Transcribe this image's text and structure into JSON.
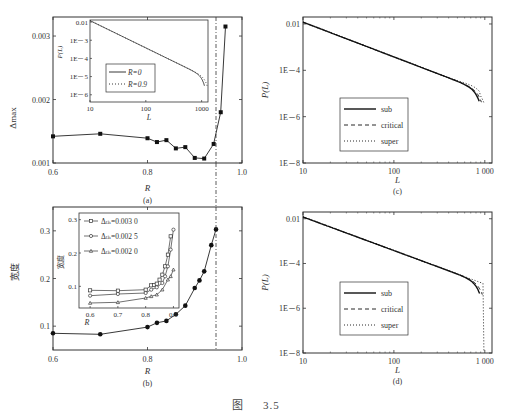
{
  "figure": {
    "caption_prefix": "图",
    "caption_number": "3.5"
  },
  "chart_data": [
    {
      "id": "a",
      "panel_label": "(a)",
      "type": "line",
      "xlabel": "R",
      "ylabel": "Δmax",
      "xlim": [
        0.6,
        1.0
      ],
      "ylim": [
        0.001,
        0.0033
      ],
      "xticks": [
        0.6,
        0.8,
        1.0
      ],
      "xtick_labels": [
        "0.6",
        "0.8",
        "1.0"
      ],
      "yticks": [
        0.001,
        0.002,
        0.003
      ],
      "ytick_labels": [
        "0.001",
        "0.002",
        "0.003"
      ],
      "vline": 0.945,
      "series": [
        {
          "name": "Δmax",
          "marker": "square-filled",
          "x": [
            0.6,
            0.7,
            0.8,
            0.82,
            0.84,
            0.86,
            0.88,
            0.9,
            0.92,
            0.94,
            0.955,
            0.965
          ],
          "y": [
            0.00142,
            0.00146,
            0.00139,
            0.00133,
            0.00136,
            0.00123,
            0.00125,
            0.00108,
            0.00107,
            0.0013,
            0.0018,
            0.00315
          ]
        }
      ],
      "inset": {
        "type": "line",
        "xscale": "log",
        "yscale": "log",
        "xlabel": "L",
        "ylabel": "P(L)",
        "xlim": [
          10,
          1300
        ],
        "ylim": [
          4e-07,
          0.013
        ],
        "xticks": [
          10,
          100,
          1000
        ],
        "xtick_labels": [
          "10",
          "100",
          "1000"
        ],
        "yticks": [
          0.01,
          0.001,
          0.0001,
          1e-05,
          1e-06
        ],
        "ytick_labels": [
          "0.01",
          "1E－3",
          "1E－4",
          "1E－5",
          "1E－6"
        ],
        "legend": [
          {
            "label": "R=0",
            "style": "solid"
          },
          {
            "label": "R=0.9",
            "style": "dotted"
          }
        ],
        "series": [
          {
            "name": "R=0",
            "exponent": -1.5,
            "cutoff": 1100
          },
          {
            "name": "R=0.9",
            "exponent": -1.5,
            "cutoff": 1250
          }
        ]
      }
    },
    {
      "id": "b",
      "panel_label": "(b)",
      "type": "line",
      "xlabel": "R",
      "ylabel": "宽度",
      "xlim": [
        0.6,
        1.0
      ],
      "ylim": [
        0.05,
        0.35
      ],
      "xticks": [
        0.6,
        0.8,
        1.0
      ],
      "xtick_labels": [
        "0.6",
        "0.8",
        "1.0"
      ],
      "yticks": [
        0.1,
        0.2,
        0.3
      ],
      "ytick_labels": [
        "0.1",
        "0.2",
        "0.3"
      ],
      "vline": 0.945,
      "series": [
        {
          "name": "宽度",
          "marker": "circle-filled",
          "x": [
            0.6,
            0.7,
            0.8,
            0.82,
            0.84,
            0.86,
            0.88,
            0.9,
            0.91,
            0.92,
            0.935,
            0.945
          ],
          "y": [
            0.085,
            0.083,
            0.098,
            0.107,
            0.111,
            0.125,
            0.143,
            0.18,
            0.196,
            0.215,
            0.27,
            0.303
          ]
        }
      ],
      "inset": {
        "type": "line",
        "xlabel": "R",
        "ylabel": "宽度",
        "xlim": [
          0.56,
          0.92
        ],
        "ylim": [
          0.035,
          0.32
        ],
        "xticks": [
          0.6,
          0.7,
          0.8,
          0.9
        ],
        "xtick_labels": [
          "0.6",
          "0.7",
          "0.8",
          "0.9"
        ],
        "yticks": [
          0.1,
          0.2,
          0.3
        ],
        "ytick_labels": [
          "0.1",
          "0.2",
          "0.3"
        ],
        "legend_symbol": "Δ",
        "legend_subscript": "th",
        "series": [
          {
            "name": "Δth=0.003 0",
            "marker": "square-open",
            "x": [
              0.6,
              0.7,
              0.8,
              0.82,
              0.83,
              0.84,
              0.85,
              0.86,
              0.87,
              0.88,
              0.89
            ],
            "y": [
              0.088,
              0.087,
              0.09,
              0.103,
              0.104,
              0.108,
              0.12,
              0.135,
              0.16,
              0.195,
              0.25
            ]
          },
          {
            "name": "Δth=0.002 5",
            "marker": "circle-open",
            "x": [
              0.6,
              0.7,
              0.8,
              0.82,
              0.84,
              0.86,
              0.87,
              0.88,
              0.89,
              0.9
            ],
            "y": [
              0.072,
              0.077,
              0.08,
              0.09,
              0.097,
              0.11,
              0.13,
              0.16,
              0.21,
              0.27
            ]
          },
          {
            "name": "Δth=0.002 0",
            "marker": "triangle-open",
            "x": [
              0.6,
              0.7,
              0.8,
              0.82,
              0.84,
              0.86,
              0.88,
              0.89,
              0.9
            ],
            "y": [
              0.05,
              0.052,
              0.065,
              0.07,
              0.075,
              0.09,
              0.12,
              0.13,
              0.15
            ]
          }
        ]
      }
    },
    {
      "id": "c",
      "panel_label": "(c)",
      "type": "line",
      "xscale": "log",
      "yscale": "log",
      "xlabel": "L",
      "ylabel": "P(L)",
      "xlim": [
        10,
        1200
      ],
      "ylim": [
        1e-08,
        0.02
      ],
      "xticks": [
        10,
        100,
        1000
      ],
      "xtick_labels": [
        "10",
        "100",
        "1 000"
      ],
      "yticks": [
        0.01,
        0.0001,
        1e-06,
        1e-08
      ],
      "ytick_labels": [
        "0.01",
        "1E－4",
        "1E－6",
        "1E－8"
      ],
      "legend": [
        {
          "label": "sub",
          "style": "solid"
        },
        {
          "label": "critical",
          "style": "dashed"
        },
        {
          "label": "super",
          "style": "dotted"
        }
      ],
      "legend_position": "lower-left",
      "series": [
        {
          "name": "sub",
          "exponent": -1.5,
          "cutoff": 850
        },
        {
          "name": "critical",
          "exponent": -1.5,
          "cutoff": 900
        },
        {
          "name": "super",
          "exponent": -1.5,
          "cutoff": 960,
          "bump": true
        }
      ]
    },
    {
      "id": "d",
      "panel_label": "(d)",
      "type": "line",
      "xscale": "log",
      "yscale": "log",
      "xlabel": "L",
      "ylabel": "P(L)",
      "xlim": [
        10,
        1200
      ],
      "ylim": [
        1e-08,
        0.02
      ],
      "xticks": [
        10,
        100,
        1000
      ],
      "xtick_labels": [
        "10",
        "100",
        "1 000"
      ],
      "yticks": [
        0.01,
        0.0001,
        1e-06,
        1e-08
      ],
      "ytick_labels": [
        "0.01",
        "1E－4",
        "1E－6",
        "1E－8"
      ],
      "legend": [
        {
          "label": "sub",
          "style": "solid"
        },
        {
          "label": "critical",
          "style": "dashed"
        },
        {
          "label": "super",
          "style": "dotted"
        }
      ],
      "legend_position": "lower-left",
      "series": [
        {
          "name": "sub",
          "exponent": -1.5,
          "cutoff": 860
        },
        {
          "name": "critical",
          "exponent": -1.5,
          "cutoff": 920
        },
        {
          "name": "super",
          "exponent": -1.5,
          "cutoff": 980,
          "plateau": 5e-05
        }
      ]
    }
  ]
}
